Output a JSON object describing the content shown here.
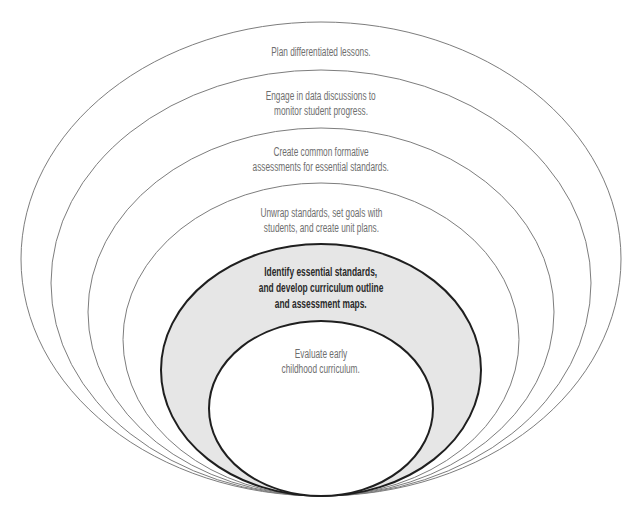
{
  "diagram": {
    "type": "nested-ellipses",
    "rings": [
      {
        "level": 1,
        "lines": [
          "Plan differentiated lessons."
        ],
        "highlighted": false
      },
      {
        "level": 2,
        "lines": [
          "Engage in data discussions to",
          "monitor student progress."
        ],
        "highlighted": false
      },
      {
        "level": 3,
        "lines": [
          "Create common formative",
          "assessments for essential standards."
        ],
        "highlighted": false
      },
      {
        "level": 4,
        "lines": [
          "Unwrap standards, set goals with",
          "students, and create unit plans."
        ],
        "highlighted": false
      },
      {
        "level": 5,
        "lines": [
          "Identify essential standards,",
          "and develop curriculum outline",
          "and assessment maps."
        ],
        "highlighted": true
      },
      {
        "level": 6,
        "lines": [
          "Evaluate early",
          "childhood curriculum."
        ],
        "highlighted": false
      }
    ],
    "colors": {
      "outline_thin": "#7d7d7d",
      "outline_bold": "#1f1f1f",
      "highlight_fill": "#e6e6e6",
      "inner_fill": "#ffffff",
      "text_regular": "#6e6e6e",
      "text_bold": "#2a2a2a"
    }
  }
}
